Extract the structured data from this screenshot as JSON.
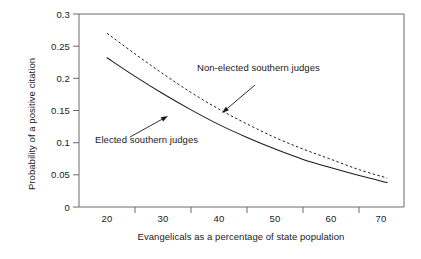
{
  "chart_data": {
    "type": "line",
    "title": "",
    "xlabel": "Evangelicals as a percentage of state population",
    "ylabel": "Probability of a positive citation",
    "xlim": [
      15,
      73
    ],
    "ylim": [
      0,
      0.3
    ],
    "grid": false,
    "legend_position": "inline-annotations",
    "x_tick_labels": [
      "20",
      "30",
      "40",
      "50",
      "60",
      "70"
    ],
    "x_tick_values": [
      20,
      30,
      40,
      50,
      60,
      70
    ],
    "x_minor_tick_values": [
      25,
      35,
      45,
      55,
      65
    ],
    "y_tick_labels": [
      "0",
      "0.05",
      "0.1",
      "0.15",
      "0.2",
      "0.25",
      "0.3"
    ],
    "y_tick_values": [
      0,
      0.05,
      0.1,
      0.15,
      0.2,
      0.25,
      0.3
    ],
    "x": [
      20,
      25,
      30,
      35,
      40,
      45,
      50,
      55,
      60,
      65,
      70
    ],
    "series": [
      {
        "name": "Non-elected southern judges",
        "style": "dashed",
        "color": "#1a1a1a",
        "values": [
          0.27,
          0.238,
          0.207,
          0.178,
          0.152,
          0.129,
          0.108,
          0.09,
          0.074,
          0.058,
          0.045
        ]
      },
      {
        "name": "Elected southern judges",
        "style": "solid",
        "color": "#1a1a1a",
        "values": [
          0.232,
          0.203,
          0.176,
          0.151,
          0.128,
          0.108,
          0.09,
          0.074,
          0.061,
          0.049,
          0.038
        ]
      }
    ],
    "annotations": [
      {
        "text": "Non-elected southern judges",
        "target_series": "Non-elected southern judges",
        "text_x_px": 197,
        "text_y_px": 68,
        "arrow_from_px": [
          255,
          85
        ],
        "arrow_to_px": [
          222,
          113
        ]
      },
      {
        "text": "Elected southern judges",
        "target_series": "Elected southern judges",
        "text_x_px": 95,
        "text_y_px": 139,
        "arrow_from_px": [
          130,
          137
        ],
        "arrow_to_px": [
          168,
          116
        ]
      }
    ]
  },
  "axes": {
    "frame_color": "#6b6b6b",
    "tick_color": "#6b6b6b"
  }
}
